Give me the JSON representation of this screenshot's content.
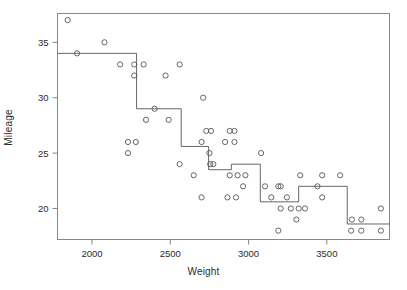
{
  "chart_data": {
    "type": "scatter",
    "title": "",
    "xlabel": "Weight",
    "ylabel": "Mileage",
    "xlim": [
      1780,
      3900
    ],
    "ylim": [
      17.2,
      37.6
    ],
    "grid": false,
    "legend": null,
    "x_ticks": [
      2000,
      2500,
      3000,
      3500
    ],
    "y_ticks": [
      20,
      25,
      30,
      35
    ],
    "x_tick_labels": [
      "2000",
      "2500",
      "3000",
      "3500"
    ],
    "y_tick_labels": [
      "20",
      "25",
      "30",
      "35"
    ],
    "marker": {
      "shape": "open-circle",
      "radius": 2.6,
      "stroke": "#555555",
      "fill": "none"
    },
    "points": [
      {
        "x": 1845,
        "y": 37
      },
      {
        "x": 1905,
        "y": 34
      },
      {
        "x": 2080,
        "y": 35
      },
      {
        "x": 2180,
        "y": 33
      },
      {
        "x": 2270,
        "y": 33
      },
      {
        "x": 2270,
        "y": 32
      },
      {
        "x": 2280,
        "y": 26
      },
      {
        "x": 2230,
        "y": 26
      },
      {
        "x": 2230,
        "y": 25
      },
      {
        "x": 2330,
        "y": 33
      },
      {
        "x": 2345,
        "y": 28
      },
      {
        "x": 2400,
        "y": 29
      },
      {
        "x": 2470,
        "y": 32
      },
      {
        "x": 2490,
        "y": 28
      },
      {
        "x": 2560,
        "y": 33
      },
      {
        "x": 2560,
        "y": 24
      },
      {
        "x": 2650,
        "y": 23
      },
      {
        "x": 2700,
        "y": 26
      },
      {
        "x": 2710,
        "y": 30
      },
      {
        "x": 2730,
        "y": 27
      },
      {
        "x": 2760,
        "y": 27
      },
      {
        "x": 2750,
        "y": 25
      },
      {
        "x": 2755,
        "y": 24
      },
      {
        "x": 2775,
        "y": 24
      },
      {
        "x": 2700,
        "y": 21
      },
      {
        "x": 2850,
        "y": 26
      },
      {
        "x": 2880,
        "y": 27
      },
      {
        "x": 2910,
        "y": 27
      },
      {
        "x": 2910,
        "y": 26
      },
      {
        "x": 2880,
        "y": 23
      },
      {
        "x": 2930,
        "y": 23
      },
      {
        "x": 2980,
        "y": 23
      },
      {
        "x": 2865,
        "y": 21
      },
      {
        "x": 2920,
        "y": 21
      },
      {
        "x": 2965,
        "y": 22
      },
      {
        "x": 3080,
        "y": 25
      },
      {
        "x": 3105,
        "y": 22
      },
      {
        "x": 3145,
        "y": 21
      },
      {
        "x": 3190,
        "y": 22
      },
      {
        "x": 3205,
        "y": 22
      },
      {
        "x": 3205,
        "y": 20
      },
      {
        "x": 3245,
        "y": 21
      },
      {
        "x": 3270,
        "y": 20
      },
      {
        "x": 3320,
        "y": 20
      },
      {
        "x": 3190,
        "y": 18
      },
      {
        "x": 3305,
        "y": 19
      },
      {
        "x": 3330,
        "y": 23
      },
      {
        "x": 3360,
        "y": 20
      },
      {
        "x": 3440,
        "y": 22
      },
      {
        "x": 3470,
        "y": 23
      },
      {
        "x": 3470,
        "y": 21
      },
      {
        "x": 3585,
        "y": 23
      },
      {
        "x": 3660,
        "y": 19
      },
      {
        "x": 3720,
        "y": 19
      },
      {
        "x": 3655,
        "y": 18
      },
      {
        "x": 3720,
        "y": 18
      },
      {
        "x": 3845,
        "y": 20
      },
      {
        "x": 3845,
        "y": 18
      }
    ],
    "step_function": {
      "name": "fitted step function",
      "stroke": "#555555",
      "stroke_width": 0.9,
      "segments": [
        {
          "x_start": 1780,
          "x_end": 2285,
          "y": 34
        },
        {
          "x_start": 2285,
          "x_end": 2570,
          "y": 29
        },
        {
          "x_start": 2570,
          "x_end": 2745,
          "y": 25.6
        },
        {
          "x_start": 2745,
          "x_end": 2890,
          "y": 23.5
        },
        {
          "x_start": 2890,
          "x_end": 3075,
          "y": 24
        },
        {
          "x_start": 3075,
          "x_end": 3320,
          "y": 20.6
        },
        {
          "x_start": 3320,
          "x_end": 3630,
          "y": 22
        },
        {
          "x_start": 3630,
          "x_end": 3900,
          "y": 18.6
        }
      ]
    }
  },
  "frame": {
    "border_color": "#888888",
    "background": "#ffffff"
  }
}
